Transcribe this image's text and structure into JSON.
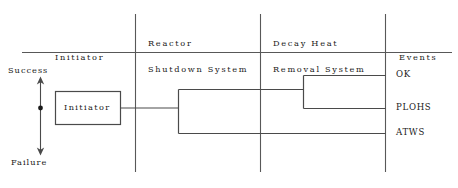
{
  "diagram": {
    "type": "event-tree",
    "columns": [
      {
        "id": "initiator",
        "lines": [
          "Initiator"
        ]
      },
      {
        "id": "rss",
        "lines": [
          "Reactor",
          "Shutdown System"
        ]
      },
      {
        "id": "dhrs",
        "lines": [
          "Decay Heat",
          "Removal System"
        ]
      },
      {
        "id": "events",
        "lines": [
          "Events"
        ]
      }
    ],
    "axis": {
      "top_label": "Success",
      "bottom_label": "Failure"
    },
    "initiator_box": {
      "label": "Initiator"
    },
    "outcomes": [
      {
        "id": "ok",
        "label": "OK"
      },
      {
        "id": "plohs",
        "label": "PLOHS"
      },
      {
        "id": "atws",
        "label": "ATWS"
      }
    ],
    "colors": {
      "line": "#4a4a4a",
      "text": "#1a1a1a",
      "background": "#ffffff"
    }
  }
}
